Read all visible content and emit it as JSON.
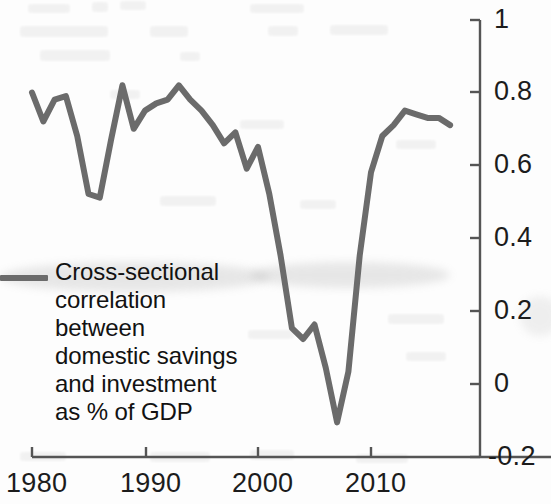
{
  "chart_data": {
    "type": "line",
    "title": "",
    "xlabel": "",
    "ylabel": "",
    "xlim": [
      1979,
      2018
    ],
    "ylim": [
      -0.2,
      1
    ],
    "grid": false,
    "legend_position": "inside-left",
    "line_color": "#6b6b6b",
    "x_ticks": [
      "1980",
      "1990",
      "2000",
      "2010"
    ],
    "x_tick_values": [
      1980,
      1990,
      2000,
      2010
    ],
    "y_ticks": [
      "1",
      "0.8",
      "0.6",
      "0.4",
      "0.2",
      "0",
      "-0.2"
    ],
    "y_tick_values": [
      1,
      0.8,
      0.6,
      0.4,
      0.2,
      0,
      -0.2
    ],
    "series": [
      {
        "name": "Cross-sectional correlation between domestic savings and investment as % of GDP",
        "x": [
          1980,
          1981,
          1982,
          1983,
          1984,
          1985,
          1986,
          1987,
          1988,
          1989,
          1990,
          1991,
          1992,
          1993,
          1994,
          1995,
          1996,
          1997,
          1998,
          1999,
          2000,
          2001,
          2002,
          2003,
          2004,
          2005,
          2006,
          2007,
          2008,
          2009,
          2010,
          2011,
          2012,
          2013,
          2014,
          2015,
          2016,
          2017
        ],
        "values": [
          0.8,
          0.72,
          0.78,
          0.79,
          0.68,
          0.52,
          0.51,
          0.67,
          0.82,
          0.7,
          0.75,
          0.77,
          0.78,
          0.82,
          0.78,
          0.75,
          0.71,
          0.66,
          0.69,
          0.59,
          0.65,
          0.52,
          0.35,
          0.15,
          0.12,
          0.16,
          0.04,
          -0.11,
          0.03,
          0.35,
          0.58,
          0.68,
          0.71,
          0.75,
          0.74,
          0.73,
          0.73,
          0.71
        ]
      }
    ]
  },
  "legend": {
    "label": "Cross-sectional correlation between domestic savings and investment as % of GDP"
  }
}
